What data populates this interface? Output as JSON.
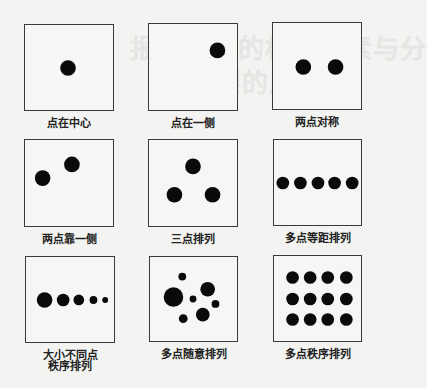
{
  "background_ghost_text": [
    "报签诺剖的构成要素与分",
    "要的原理",
    "基本形 · 版式中的构成"
  ],
  "panels": [
    {
      "label": "点在中心",
      "box": {
        "x": 24,
        "y": 24,
        "w": 90,
        "h": 87
      },
      "dots": [
        {
          "cx": 44,
          "cy": 44,
          "r": 8
        }
      ]
    },
    {
      "label": "点在一侧",
      "box": {
        "x": 148,
        "y": 23,
        "w": 90,
        "h": 88
      },
      "dots": [
        {
          "cx": 70,
          "cy": 27,
          "r": 8
        }
      ]
    },
    {
      "label": "两点对称",
      "box": {
        "x": 272,
        "y": 22,
        "w": 90,
        "h": 88
      },
      "dots": [
        {
          "cx": 31,
          "cy": 45,
          "r": 8
        },
        {
          "cx": 64,
          "cy": 45,
          "r": 8
        }
      ]
    },
    {
      "label": "两点靠一侧",
      "box": {
        "x": 24,
        "y": 139,
        "w": 90,
        "h": 88
      },
      "dots": [
        {
          "cx": 18,
          "cy": 39,
          "r": 8
        },
        {
          "cx": 48,
          "cy": 25,
          "r": 8
        }
      ]
    },
    {
      "label": "三点排列",
      "box": {
        "x": 148,
        "y": 139,
        "w": 90,
        "h": 88
      },
      "dots": [
        {
          "cx": 45,
          "cy": 27,
          "r": 8
        },
        {
          "cx": 26,
          "cy": 56,
          "r": 8
        },
        {
          "cx": 65,
          "cy": 56,
          "r": 8
        }
      ]
    },
    {
      "label": "多点等距排列",
      "box": {
        "x": 273,
        "y": 139,
        "w": 89,
        "h": 87
      },
      "dots": [
        {
          "cx": 9,
          "cy": 44,
          "r": 6.5
        },
        {
          "cx": 27,
          "cy": 44,
          "r": 6.5
        },
        {
          "cx": 45,
          "cy": 44,
          "r": 6.5
        },
        {
          "cx": 62,
          "cy": 44,
          "r": 6.5
        },
        {
          "cx": 80,
          "cy": 44,
          "r": 6.5
        }
      ]
    },
    {
      "label": "大小不同点\n秩序排列",
      "label_lines": [
        "大小不同点",
        "秩序排列"
      ],
      "box": {
        "x": 25,
        "y": 256,
        "w": 90,
        "h": 87
      },
      "dots": [
        {
          "cx": 19,
          "cy": 44,
          "r": 8
        },
        {
          "cx": 38,
          "cy": 44,
          "r": 6.5
        },
        {
          "cx": 54,
          "cy": 44,
          "r": 5.5
        },
        {
          "cx": 69,
          "cy": 44,
          "r": 4
        },
        {
          "cx": 81,
          "cy": 44,
          "r": 3
        }
      ]
    },
    {
      "label": "多点随意排列",
      "box": {
        "x": 149,
        "y": 256,
        "w": 89,
        "h": 86
      },
      "dots": [
        {
          "cx": 33,
          "cy": 20,
          "r": 4
        },
        {
          "cx": 24,
          "cy": 41,
          "r": 10
        },
        {
          "cx": 44,
          "cy": 43,
          "r": 3.5
        },
        {
          "cx": 59,
          "cy": 33,
          "r": 7.5
        },
        {
          "cx": 67,
          "cy": 48,
          "r": 4
        },
        {
          "cx": 54,
          "cy": 59,
          "r": 7
        },
        {
          "cx": 34,
          "cy": 63,
          "r": 4.5
        }
      ]
    },
    {
      "label": "多点秩序排列",
      "box": {
        "x": 273,
        "y": 255,
        "w": 89,
        "h": 87
      },
      "dots": [
        {
          "cx": 19,
          "cy": 22,
          "r": 6.5
        },
        {
          "cx": 37,
          "cy": 22,
          "r": 6.5
        },
        {
          "cx": 55,
          "cy": 22,
          "r": 6.5
        },
        {
          "cx": 74,
          "cy": 22,
          "r": 6.5
        },
        {
          "cx": 19,
          "cy": 44,
          "r": 6.5
        },
        {
          "cx": 37,
          "cy": 44,
          "r": 6.5
        },
        {
          "cx": 55,
          "cy": 44,
          "r": 6.5
        },
        {
          "cx": 74,
          "cy": 44,
          "r": 6.5
        },
        {
          "cx": 19,
          "cy": 65,
          "r": 6.5
        },
        {
          "cx": 37,
          "cy": 65,
          "r": 6.5
        },
        {
          "cx": 55,
          "cy": 65,
          "r": 6.5
        },
        {
          "cx": 74,
          "cy": 65,
          "r": 6.5
        }
      ]
    }
  ],
  "colors": {
    "dot": "#0a0a0a",
    "border": "#3a3a3a",
    "background": "#f3f3f1"
  }
}
